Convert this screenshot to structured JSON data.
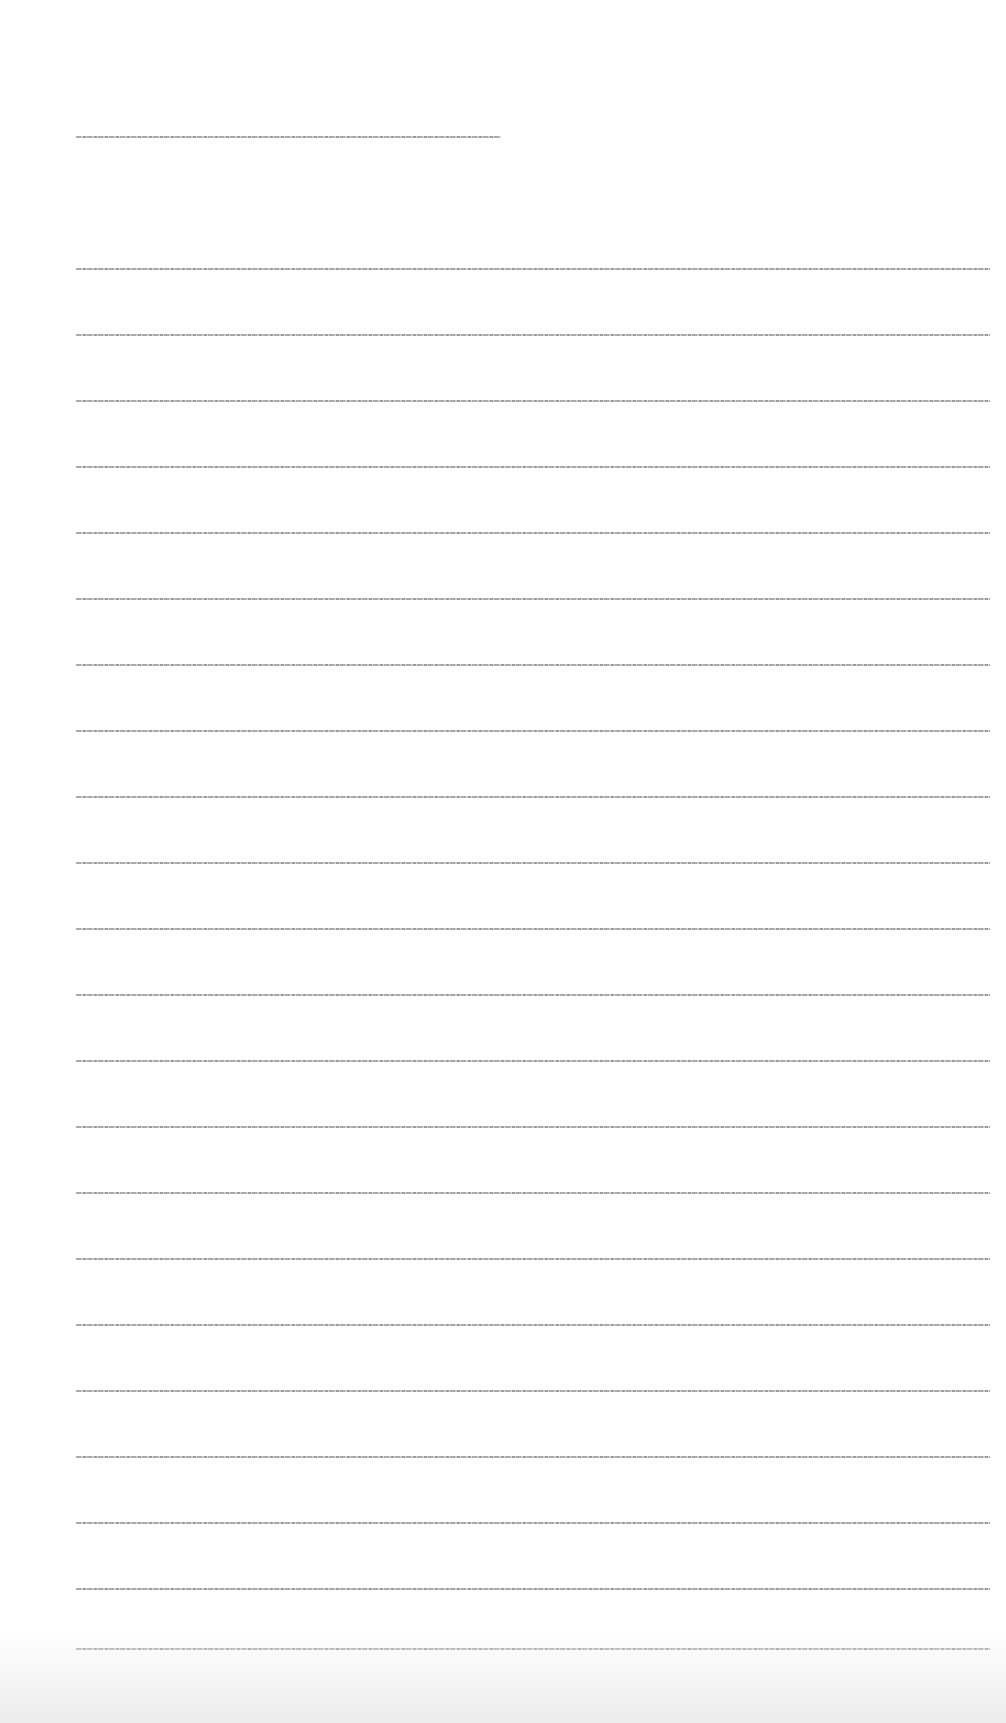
{
  "document": {
    "title": "",
    "lines": [
      {
        "top": 268,
        "text": ""
      },
      {
        "top": 334,
        "text": ""
      },
      {
        "top": 400,
        "text": ""
      },
      {
        "top": 466,
        "text": ""
      },
      {
        "top": 532,
        "text": ""
      },
      {
        "top": 598,
        "text": ""
      },
      {
        "top": 664,
        "text": ""
      },
      {
        "top": 730,
        "text": ""
      },
      {
        "top": 796,
        "text": ""
      },
      {
        "top": 862,
        "text": ""
      },
      {
        "top": 928,
        "text": ""
      },
      {
        "top": 994,
        "text": ""
      },
      {
        "top": 1060,
        "text": ""
      },
      {
        "top": 1126,
        "text": ""
      },
      {
        "top": 1192,
        "text": ""
      },
      {
        "top": 1258,
        "text": ""
      },
      {
        "top": 1324,
        "text": ""
      },
      {
        "top": 1390,
        "text": ""
      },
      {
        "top": 1456,
        "text": ""
      },
      {
        "top": 1522,
        "text": ""
      },
      {
        "top": 1588,
        "text": ""
      },
      {
        "top": 1648,
        "text": ""
      }
    ]
  }
}
